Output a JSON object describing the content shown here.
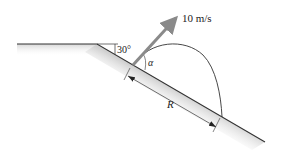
{
  "diagram": {
    "type": "projectile-on-incline",
    "labels": {
      "velocity": "10 m/s",
      "slope_angle": "30°",
      "launch_angle": "α",
      "range": "R"
    },
    "colors": {
      "ground_line": "#333333",
      "ground_fill": "#dcdcdc",
      "velocity_arrow": "#8a8a8a",
      "trajectory": "#333333",
      "dimension": "#333333"
    }
  }
}
